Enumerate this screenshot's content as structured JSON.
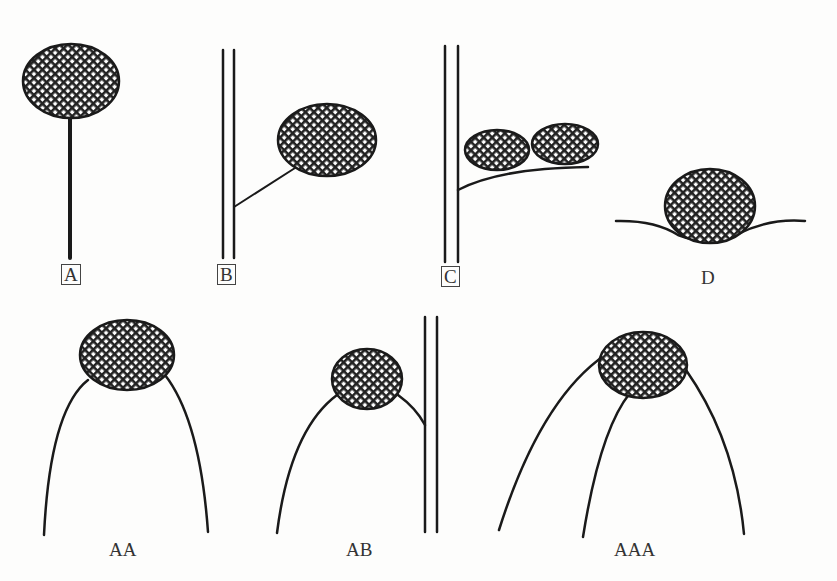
{
  "diagram": {
    "panels": [
      {
        "id": "A",
        "label": "A",
        "boxed": true,
        "description": "single ellipse on a straight vertical stalk"
      },
      {
        "id": "B",
        "label": "B",
        "boxed": true,
        "description": "ellipse attached by a short branch to a double vertical line"
      },
      {
        "id": "C",
        "label": "C",
        "boxed": true,
        "description": "two ellipses resting on a branch from a double vertical line"
      },
      {
        "id": "D",
        "label": "D",
        "boxed": false,
        "description": "ellipse resting in a shallow curved depression"
      },
      {
        "id": "AA",
        "label": "AA",
        "boxed": false,
        "description": "ellipse atop two arched curves"
      },
      {
        "id": "AB",
        "label": "AB",
        "boxed": false,
        "description": "ellipse between an arched curve and a double vertical line"
      },
      {
        "id": "AAA",
        "label": "AAA",
        "boxed": false,
        "description": "ellipse atop three arched curves"
      }
    ],
    "fill_pattern": "crosshatch",
    "stroke_color": "#1a1a1a",
    "background_color": "#fdfdfc"
  }
}
